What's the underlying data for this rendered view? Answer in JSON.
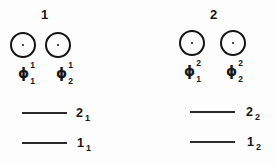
{
  "figure": {
    "ink_color": "#141414",
    "background_color": "#fdfdfd",
    "groups": [
      {
        "title": "1",
        "orbitals": [
          {
            "symbol": "ϕ",
            "sup": "1",
            "sub": "1"
          },
          {
            "symbol": "ϕ",
            "sup": "1",
            "sub": "2"
          }
        ],
        "levels": [
          {
            "label": "2",
            "sub": "1"
          },
          {
            "label": "1",
            "sub": "1"
          }
        ]
      },
      {
        "title": "2",
        "orbitals": [
          {
            "symbol": "ϕ",
            "sup": "2",
            "sub": "1"
          },
          {
            "symbol": "ϕ",
            "sup": "2",
            "sub": "2"
          }
        ],
        "levels": [
          {
            "label": "2",
            "sub": "2"
          },
          {
            "label": "1",
            "sub": "2"
          }
        ]
      }
    ]
  }
}
